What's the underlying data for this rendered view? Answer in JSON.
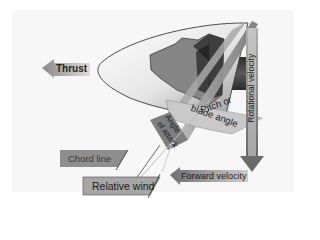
{
  "diagram": {
    "colors": {
      "background": "#f7f7f7",
      "blade_dark": "#4a4a4a",
      "blade_mid": "#8a8a8a",
      "blade_light": "#c8c8c8",
      "label_fill": "#9a9a9a",
      "arrow_fill": "#8c8c8c",
      "text": "#1c1c1c"
    },
    "labels": {
      "thrust": "Thrust",
      "rotational_velocity": "Rotational velocity",
      "pitch_line1": "Pitch or",
      "pitch_line2": "blade angle",
      "angle_line1": "Angle",
      "angle_line2": "of attack",
      "chord_line": "Chord line",
      "relative_wind": "Relative wind",
      "forward_velocity": "Forward velocity"
    }
  }
}
